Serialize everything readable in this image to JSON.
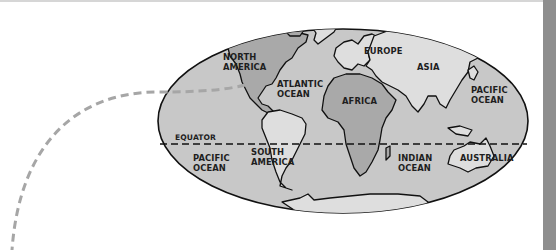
{
  "map": {
    "type": "world-map-ellipse",
    "colors": {
      "background": "#ffffff",
      "ocean": "#c8c8c8",
      "highlight_land": "#a9a9a9",
      "land": "#dedede",
      "outline": "#111111",
      "route": "#a6a6a6",
      "side_bar": "#8e8e8e"
    },
    "labels": {
      "north_america_1": "NORTH",
      "north_america_2": "AMERICA",
      "atlantic_1": "ATLANTIC",
      "atlantic_2": "OCEAN",
      "europe": "EUROPE",
      "asia": "ASIA",
      "pacific_east_1": "PACIFIC",
      "pacific_east_2": "OCEAN",
      "africa": "AFRICA",
      "equator": "EQUATOR",
      "pacific_west_1": "PACIFIC",
      "pacific_west_2": "OCEAN",
      "south_america_1": "SOUTH",
      "south_america_2": "AMERICA",
      "indian_1": "INDIAN",
      "indian_2": "OCEAN",
      "australia": "AUSTRALIA"
    },
    "highlighted_regions": [
      "North America",
      "Africa"
    ]
  }
}
